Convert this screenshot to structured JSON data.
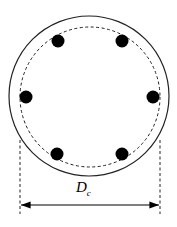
{
  "diagram": {
    "dimension_label": "D",
    "dimension_subscript": "c",
    "outer_circle": {
      "cx": 89,
      "cy": 96,
      "r": 80
    },
    "core_circle": {
      "cx": 90,
      "cy": 97,
      "r": 70,
      "style": "dashed"
    },
    "bars": [
      {
        "cx": 58,
        "cy": 41
      },
      {
        "cx": 122,
        "cy": 41
      },
      {
        "cx": 26,
        "cy": 97
      },
      {
        "cx": 153,
        "cy": 97
      },
      {
        "cx": 57,
        "cy": 154
      },
      {
        "cx": 122,
        "cy": 154
      }
    ],
    "bar_radius": 6.5,
    "dimension_line": {
      "x1": 20,
      "x2": 160,
      "y": 205
    }
  }
}
